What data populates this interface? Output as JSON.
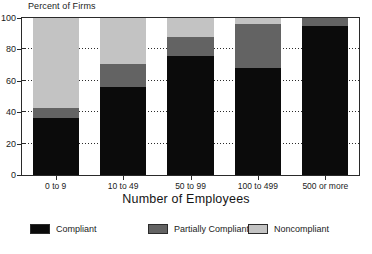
{
  "chart_data": {
    "type": "bar",
    "subtype": "stacked-bar",
    "title": "",
    "ylabel": "Percent of Firms",
    "xlabel": "Number of Employees",
    "categories": [
      "0 to 9",
      "10 to 49",
      "50 to 99",
      "100 to 499",
      "500 or more"
    ],
    "series": [
      {
        "name": "Compliant",
        "color": "#0b0b0b",
        "values": [
          36,
          56,
          76,
          68,
          95
        ]
      },
      {
        "name": "Partially Compliant",
        "color": "#636363",
        "values": [
          7,
          15,
          12,
          28,
          5
        ]
      },
      {
        "name": "Noncompliant",
        "color": "#c3c3c3",
        "values": [
          57,
          29,
          12,
          4,
          0
        ]
      }
    ],
    "ylim": [
      0,
      100
    ],
    "yticks": [
      0,
      20,
      40,
      60,
      80,
      100
    ],
    "ytick_labels": [
      "0",
      "20",
      "40",
      "60",
      "80",
      "100"
    ],
    "grid": true,
    "grid_style": "dotted-horizontal",
    "legend_position": "bottom",
    "stack_order": "bottom-to-top"
  },
  "axes": {
    "y_caption": "Percent of Firms",
    "x_title": "Number of Employees"
  },
  "legend": {
    "items": [
      {
        "label": "Compliant",
        "color": "#0b0b0b"
      },
      {
        "label": "Partially Compliant",
        "color": "#636363"
      },
      {
        "label": "Noncompliant",
        "color": "#c3c3c3"
      }
    ]
  }
}
